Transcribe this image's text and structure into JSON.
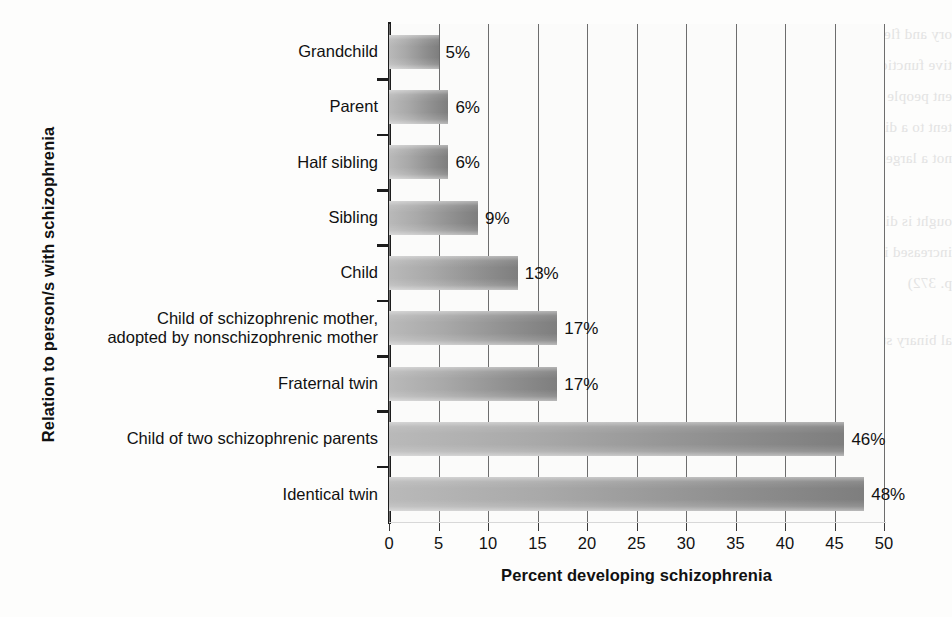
{
  "chart_data": {
    "type": "bar",
    "orientation": "horizontal",
    "title": "",
    "xlabel": "Percent developing schizophrenia",
    "ylabel": "Relation to person/s with schizophrenia",
    "xlim": [
      0,
      50
    ],
    "xticks": [
      "0",
      "5",
      "10",
      "15",
      "20",
      "25",
      "30",
      "35",
      "40",
      "45",
      "50"
    ],
    "grid": "vertical",
    "legend": "none",
    "categories": [
      "Grandchild",
      "Parent",
      "Half sibling",
      "Sibling",
      "Child",
      "Child of schizophrenic mother,\nadopted by nonschizophrenic mother",
      "Fraternal twin",
      "Child of two schizophrenic parents",
      "Identical twin"
    ],
    "values": [
      5,
      6,
      6,
      9,
      13,
      17,
      17,
      46,
      48
    ],
    "value_labels": [
      "5%",
      "6%",
      "6%",
      "9%",
      "13%",
      "17%",
      "17%",
      "46%",
      "48%"
    ],
    "bar_color": "#9a9a9a",
    "bar_color_light": "#b9b9b9",
    "bar_color_dark": "#7e7e7e",
    "gridline_color": "#6d6d6d",
    "axis_color": "#1c1c1c",
    "text_color": "#111111",
    "background": "#fdfdfc"
  },
  "ghost_text": {
    "lines": [
      "ory and flexural impairments on",
      "tive function. (Table 1.43, 2012)",
      "ent people reason a task of risks",
      "tent to a different dose for pills by",
      "not a larger trouble cast line, as the",
      "ought is difficultly used abstract",
      "increased interested at as just the illustrated",
      "p. 372)",
      "al binary stimuli."
    ]
  }
}
